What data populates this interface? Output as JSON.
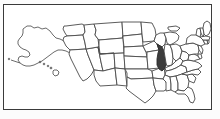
{
  "figure": {
    "kind": "choropleth-locator-map",
    "subject_region": "United States of America",
    "projection_note": "Alaska and Hawaii shown as insets at lower left of frame",
    "background_color": "#ffffff",
    "outer_margin_color": "#fcfcfc",
    "frame": {
      "border_color": "#3a3a3a",
      "border_width_px": 1,
      "inset_left_px": 3,
      "inset_top_px": 4,
      "width_px": 209,
      "height_px": 106
    },
    "state_outline_color": "#4a4a4a",
    "state_fill_color": "#ffffff",
    "highlight_fill_color": "#3c3c3c",
    "highlight_stroke_color": "#2a2a2a"
  },
  "highlight": {
    "state_name": "Illinois",
    "state_code": "IL",
    "fill": "#3c3c3c",
    "label_text": "",
    "approx_bbox_px": {
      "x": 152,
      "y": 38,
      "width": 11,
      "height": 32
    }
  },
  "legend": {
    "visible": false,
    "entries": []
  },
  "labels": {
    "visible": false,
    "texts": []
  },
  "insets": [
    {
      "name": "Alaska",
      "code": "AK",
      "position": "upper-left",
      "highlighted": false
    },
    {
      "name": "Hawaii",
      "code": "HI",
      "position": "left-center",
      "highlighted": false
    }
  ],
  "states": [
    {
      "code": "WA",
      "name": "Washington",
      "highlighted": false
    },
    {
      "code": "OR",
      "name": "Oregon",
      "highlighted": false
    },
    {
      "code": "CA",
      "name": "California",
      "highlighted": false
    },
    {
      "code": "NV",
      "name": "Nevada",
      "highlighted": false
    },
    {
      "code": "ID",
      "name": "Idaho",
      "highlighted": false
    },
    {
      "code": "MT",
      "name": "Montana",
      "highlighted": false
    },
    {
      "code": "WY",
      "name": "Wyoming",
      "highlighted": false
    },
    {
      "code": "UT",
      "name": "Utah",
      "highlighted": false
    },
    {
      "code": "AZ",
      "name": "Arizona",
      "highlighted": false
    },
    {
      "code": "CO",
      "name": "Colorado",
      "highlighted": false
    },
    {
      "code": "NM",
      "name": "New Mexico",
      "highlighted": false
    },
    {
      "code": "ND",
      "name": "North Dakota",
      "highlighted": false
    },
    {
      "code": "SD",
      "name": "South Dakota",
      "highlighted": false
    },
    {
      "code": "NE",
      "name": "Nebraska",
      "highlighted": false
    },
    {
      "code": "KS",
      "name": "Kansas",
      "highlighted": false
    },
    {
      "code": "OK",
      "name": "Oklahoma",
      "highlighted": false
    },
    {
      "code": "TX",
      "name": "Texas",
      "highlighted": false
    },
    {
      "code": "MN",
      "name": "Minnesota",
      "highlighted": false
    },
    {
      "code": "IA",
      "name": "Iowa",
      "highlighted": false
    },
    {
      "code": "MO",
      "name": "Missouri",
      "highlighted": false
    },
    {
      "code": "AR",
      "name": "Arkansas",
      "highlighted": false
    },
    {
      "code": "LA",
      "name": "Louisiana",
      "highlighted": false
    },
    {
      "code": "WI",
      "name": "Wisconsin",
      "highlighted": false
    },
    {
      "code": "IL",
      "name": "Illinois",
      "highlighted": true
    },
    {
      "code": "MS",
      "name": "Mississippi",
      "highlighted": false
    },
    {
      "code": "MI",
      "name": "Michigan",
      "highlighted": false
    },
    {
      "code": "IN",
      "name": "Indiana",
      "highlighted": false
    },
    {
      "code": "OH",
      "name": "Ohio",
      "highlighted": false
    },
    {
      "code": "KY",
      "name": "Kentucky",
      "highlighted": false
    },
    {
      "code": "TN",
      "name": "Tennessee",
      "highlighted": false
    },
    {
      "code": "AL",
      "name": "Alabama",
      "highlighted": false
    },
    {
      "code": "GA",
      "name": "Georgia",
      "highlighted": false
    },
    {
      "code": "FL",
      "name": "Florida",
      "highlighted": false
    },
    {
      "code": "SC",
      "name": "South Carolina",
      "highlighted": false
    },
    {
      "code": "NC",
      "name": "North Carolina",
      "highlighted": false
    },
    {
      "code": "VA",
      "name": "Virginia",
      "highlighted": false
    },
    {
      "code": "WV",
      "name": "West Virginia",
      "highlighted": false
    },
    {
      "code": "MD",
      "name": "Maryland",
      "highlighted": false
    },
    {
      "code": "DE",
      "name": "Delaware",
      "highlighted": false
    },
    {
      "code": "PA",
      "name": "Pennsylvania",
      "highlighted": false
    },
    {
      "code": "NJ",
      "name": "New Jersey",
      "highlighted": false
    },
    {
      "code": "NY",
      "name": "New York",
      "highlighted": false
    },
    {
      "code": "CT",
      "name": "Connecticut",
      "highlighted": false
    },
    {
      "code": "RI",
      "name": "Rhode Island",
      "highlighted": false
    },
    {
      "code": "MA",
      "name": "Massachusetts",
      "highlighted": false
    },
    {
      "code": "VT",
      "name": "Vermont",
      "highlighted": false
    },
    {
      "code": "NH",
      "name": "New Hampshire",
      "highlighted": false
    },
    {
      "code": "ME",
      "name": "Maine",
      "highlighted": false
    }
  ]
}
